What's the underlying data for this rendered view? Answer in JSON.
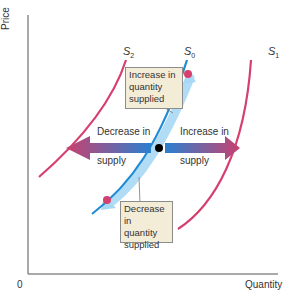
{
  "axes": {
    "y_label": "Price",
    "x_label": "Quantity",
    "origin_label": "0"
  },
  "curves": [
    {
      "id": "S2",
      "letter": "S",
      "subscript": "2",
      "color": "#d6406e"
    },
    {
      "id": "S0",
      "letter": "S",
      "subscript": "0",
      "color": "#1f8ad6"
    },
    {
      "id": "S1",
      "letter": "S",
      "subscript": "1",
      "color": "#d6406e"
    }
  ],
  "arrows": {
    "left": {
      "line1": "Decrease in",
      "line2": "supply"
    },
    "right": {
      "line1": "Increase in",
      "line2": "supply"
    }
  },
  "notes": {
    "top": {
      "line1": "Increase in",
      "line2": "quantity",
      "line3": "supplied"
    },
    "bottom": {
      "line1": "Decrease in",
      "line2": "quantity",
      "line3": "supplied"
    }
  },
  "colors": {
    "supply_shift_curve": "#d6406e",
    "original_supply_curve": "#1f8ad6",
    "movement_glow": "#a9d8f5",
    "note_bg": "#f3ecd7",
    "equilibrium_point": "#000000"
  }
}
